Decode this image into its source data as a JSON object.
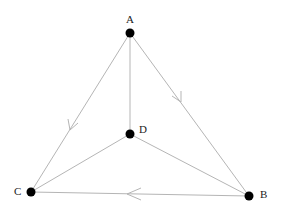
{
  "diagram": {
    "type": "directed-graph",
    "nodes": [
      {
        "id": "A",
        "label": "A",
        "x": 130,
        "y": 33,
        "lx": 126,
        "ly": 23
      },
      {
        "id": "B",
        "label": "B",
        "x": 249,
        "y": 196,
        "lx": 260,
        "ly": 198
      },
      {
        "id": "C",
        "label": "C",
        "x": 31,
        "y": 192,
        "lx": 14,
        "ly": 195
      },
      {
        "id": "D",
        "label": "D",
        "x": 130,
        "y": 134,
        "lx": 139,
        "ly": 133
      }
    ],
    "edges": [
      {
        "from": "A",
        "to": "B",
        "arrow": true
      },
      {
        "from": "A",
        "to": "C",
        "arrow": true
      },
      {
        "from": "B",
        "to": "C",
        "arrow": true
      },
      {
        "from": "A",
        "to": "D",
        "arrow": false
      },
      {
        "from": "D",
        "to": "B",
        "arrow": false
      },
      {
        "from": "D",
        "to": "C",
        "arrow": false
      }
    ],
    "colors": {
      "edge": "#b5b5b5",
      "node": "#000000",
      "label": "#222222"
    }
  }
}
